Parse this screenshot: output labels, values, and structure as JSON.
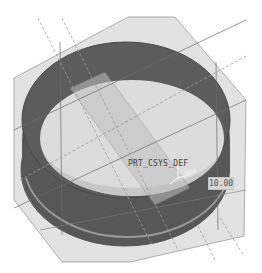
{
  "viewport": {
    "model": "cylindrical ring shell",
    "csys_label": "PRT_CSYS_DEF",
    "dimension_value": "10.00",
    "colors": {
      "background": "#ffffff",
      "ring_outer": "#5a5a5a",
      "ring_inner": "#6e6e6e",
      "datum_plane": "#d9d9d9",
      "datum_edge": "#8a8a8a",
      "axis_dashed": "#9a9a9a",
      "floor": "#e6e6e6"
    }
  }
}
